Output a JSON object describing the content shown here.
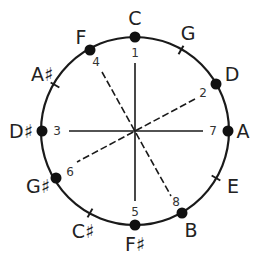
{
  "diagram": {
    "title": "",
    "center": [
      135,
      131
    ],
    "radius": 94,
    "colors": {
      "stroke": "#1a1a1a",
      "text": "#222222",
      "background": "#ffffff"
    },
    "notes": [
      {
        "label": "C",
        "x": 135,
        "y": 25,
        "marker": "dot",
        "mx": 135,
        "my": 37
      },
      {
        "label": "G",
        "x": 188,
        "y": 40,
        "marker": "tick",
        "mx": 181,
        "my": 50
      },
      {
        "label": "D",
        "x": 232,
        "y": 81,
        "marker": "dot",
        "mx": 216,
        "my": 84
      },
      {
        "label": "A",
        "x": 243,
        "y": 138,
        "marker": "dot",
        "mx": 228,
        "my": 131
      },
      {
        "label": "E",
        "x": 233,
        "y": 193,
        "marker": "tick",
        "mx": 216,
        "my": 178
      },
      {
        "label": "B",
        "x": 191,
        "y": 237,
        "marker": "dot",
        "mx": 182,
        "my": 213
      },
      {
        "label": "F♯",
        "x": 135,
        "y": 251,
        "marker": "dot",
        "mx": 135,
        "my": 225
      },
      {
        "label": "C♯",
        "x": 83,
        "y": 238,
        "marker": "tick",
        "mx": 90,
        "my": 213
      },
      {
        "label": "G♯",
        "x": 38,
        "y": 193,
        "marker": "dot",
        "mx": 56,
        "my": 178
      },
      {
        "label": "D♯",
        "x": 21,
        "y": 138,
        "marker": "dot",
        "mx": 42,
        "my": 131
      },
      {
        "label": "A♯",
        "x": 42,
        "y": 81,
        "marker": "tick",
        "mx": 55,
        "my": 85
      },
      {
        "label": "F",
        "x": 81,
        "y": 44,
        "marker": "dot",
        "mx": 90,
        "my": 50
      }
    ],
    "step_labels": [
      {
        "label": "1",
        "x": 135,
        "y": 57
      },
      {
        "label": "2",
        "x": 203,
        "y": 97
      },
      {
        "label": "3",
        "x": 57,
        "y": 135
      },
      {
        "label": "4",
        "x": 96,
        "y": 66
      },
      {
        "label": "5",
        "x": 135,
        "y": 216
      },
      {
        "label": "6",
        "x": 70,
        "y": 176
      },
      {
        "label": "7",
        "x": 213,
        "y": 135
      },
      {
        "label": "8",
        "x": 176,
        "y": 206
      }
    ],
    "lines": [
      {
        "from": "1",
        "to": "5",
        "style": "solid",
        "x1": 135,
        "y1": 63,
        "x2": 135,
        "y2": 201
      },
      {
        "from": "3",
        "to": "7",
        "style": "solid",
        "x1": 69,
        "y1": 131,
        "x2": 203,
        "y2": 131
      },
      {
        "from": "4",
        "to": "8",
        "style": "dashed",
        "x1": 102,
        "y1": 72,
        "x2": 171,
        "y2": 196
      },
      {
        "from": "2",
        "to": "6",
        "style": "dashed",
        "x1": 195,
        "y1": 99,
        "x2": 77,
        "y2": 162
      }
    ]
  }
}
